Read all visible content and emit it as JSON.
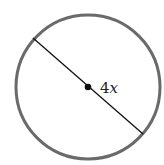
{
  "diagram": {
    "type": "circle-with-diameter",
    "label_number": "4",
    "label_variable": "x",
    "label": "4x",
    "colors": {
      "circle": "#666666",
      "line": "#111111",
      "center": "#111111"
    }
  }
}
